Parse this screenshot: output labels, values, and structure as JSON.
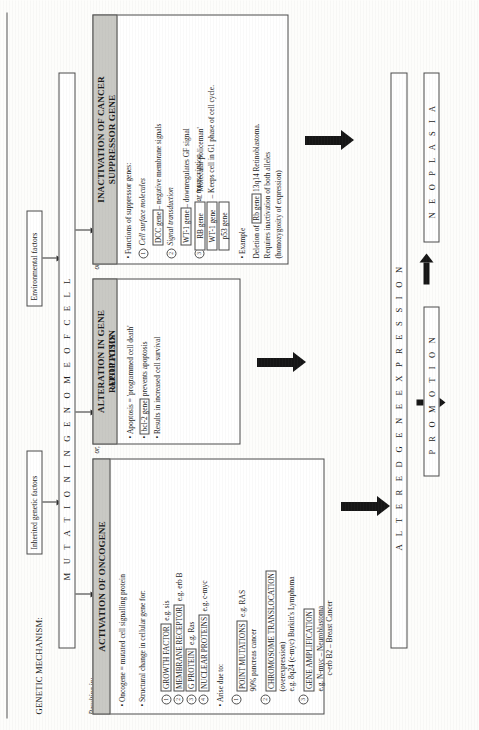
{
  "header": {
    "genetic_mechanism": "GENETIC MECHANISM:",
    "resulting_in": "Resulting in:",
    "or_1": "or,",
    "or_2": "or,"
  },
  "inputs": {
    "inherited": "Inherited genetic factors",
    "environmental": "Environmental factors"
  },
  "spine": {
    "mutation": "M U T A T I O N   I N   G E N O M E   O F   C E L L",
    "altered_gene_expression": "A L T E R E D   G E N E   E X P R E S S I O N",
    "promotion": "P R O M O T I O N",
    "neoplasia": "N E O P L A S I A"
  },
  "oncogene": {
    "title": "ACTIVATION OF ONCOGENE",
    "bullets": [
      "Oncogene = mutated cell signalling protein",
      "Structural change in cellular gene for:"
    ],
    "functions": [
      {
        "n": "1",
        "label": "GROWTH FACTOR",
        "eg": "e.g. sis"
      },
      {
        "n": "2",
        "label": "MEMBRANE RECEPTOR",
        "eg": "e.g. erb B"
      },
      {
        "n": "3",
        "label": "G PROTEIN",
        "eg": "e.g. Ras"
      },
      {
        "n": "4",
        "label": "NUCLEAR PROTEINS",
        "eg": "e.g. c-myc"
      }
    ],
    "arise_due_to": "Arise due to:",
    "causes": [
      {
        "n": "1",
        "label": "POINT MUTATIONS",
        "eg": "e.g. RAS",
        "note": "90% pancreas cancer"
      },
      {
        "n": "2",
        "label": "CHROMOSOME TRANSLOCATION",
        "eg": "(overexpression)",
        "note": "e.g. 8q24 (c-myc) Burkitt's Lymphoma"
      },
      {
        "n": "3",
        "label": "GENE AMPLIFICATION",
        "eg": "e.g. N-myc – Neuroblastoma",
        "note": "c-erb B2 – Breast Cancer"
      }
    ]
  },
  "apoptosis": {
    "title": "ALTERATION IN GENE REGULATION APOPTOSIS",
    "title_line1": "ALTERATION IN GENE REGULATION",
    "title_line2": "APOPTOSIS",
    "bullets": [
      "Apoptosis = 'programmed cell death'",
      "bcl-2 gene prevents apoptosis",
      "Results in increased cell survival"
    ],
    "gene_tag": "bcl-2 gene",
    "bullet2_prefix": "",
    "bullet2_suffix": " prevents apoptosis"
  },
  "suppressor": {
    "title_line1": "INACTIVATION OF CANCER",
    "title_line2": "SUPPRESSOR GENE",
    "intro": "Functions of suppressor genes:",
    "groups": [
      {
        "n": "1",
        "italic": "Cell surface molecules",
        "gene": "DCC gene",
        "desc": "– negative membrane signals"
      },
      {
        "n": "2",
        "italic": "Signal transduction",
        "gene": "WT-1 gene",
        "desc": "– downregulates GF signal"
      },
      {
        "n": "3",
        "italic": "Regulate nuclear transcription",
        "gene": "",
        "desc": ""
      }
    ],
    "gene_list": [
      "RB gene",
      "WT-1 gene",
      "p53 gene"
    ],
    "gene_notes": [
      "– 'Molecular policeman'",
      "– Keeps cell in G1 phase of cell cycle."
    ],
    "example_label": "Example",
    "example_lines": [
      "Deletion of  13q14 Retinoblastoma.",
      "Requires inactivation of both alleles",
      "(homozygosity of expression)"
    ],
    "example_gene": "Rb gene"
  },
  "colors": {
    "header_fill": "#c9c9c4",
    "ink": "#1a1a1a",
    "arrow": "#161616"
  }
}
